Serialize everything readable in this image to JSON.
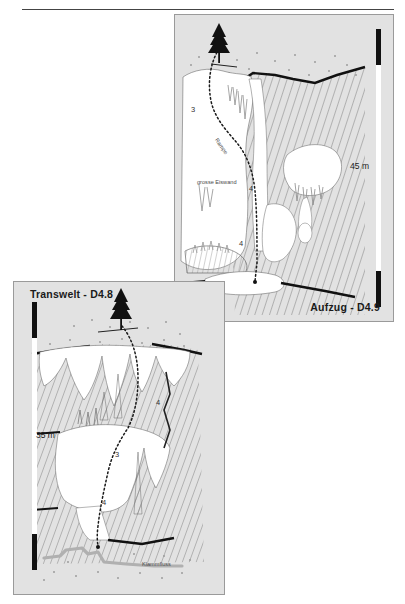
{
  "page": {
    "background_color": "#ffffff",
    "rule_color": "#444444"
  },
  "panels": [
    {
      "id": "aufzug",
      "title": "Aufzug - D4.9",
      "background_color": "#e2e2e2",
      "border_color": "#9a9a9a",
      "scale_label": "45 m",
      "scale_position": "right",
      "route_numbers": [
        "3",
        "4",
        "4"
      ],
      "feature_labels": [
        "grosse Eiswand",
        "Rampe"
      ],
      "surface_icon": "conifer-tree-icon",
      "route_style": "dotted"
    },
    {
      "id": "transwelt",
      "title": "Transwelt - D4.8",
      "background_color": "#e2e2e2",
      "border_color": "#9a9a9a",
      "scale_label": "35 m",
      "scale_position": "left",
      "route_numbers": [
        "4",
        "3",
        "4"
      ],
      "feature_labels": [
        "Klammfluss"
      ],
      "surface_icon": "conifer-tree-icon",
      "route_style": "dotted",
      "water_color": "#b0b0b0"
    }
  ],
  "colors": {
    "ice_fill": "#ffffff",
    "rock_hatch": "#8c8c8c",
    "ink": "#111111",
    "water": "#b0b0b0"
  }
}
